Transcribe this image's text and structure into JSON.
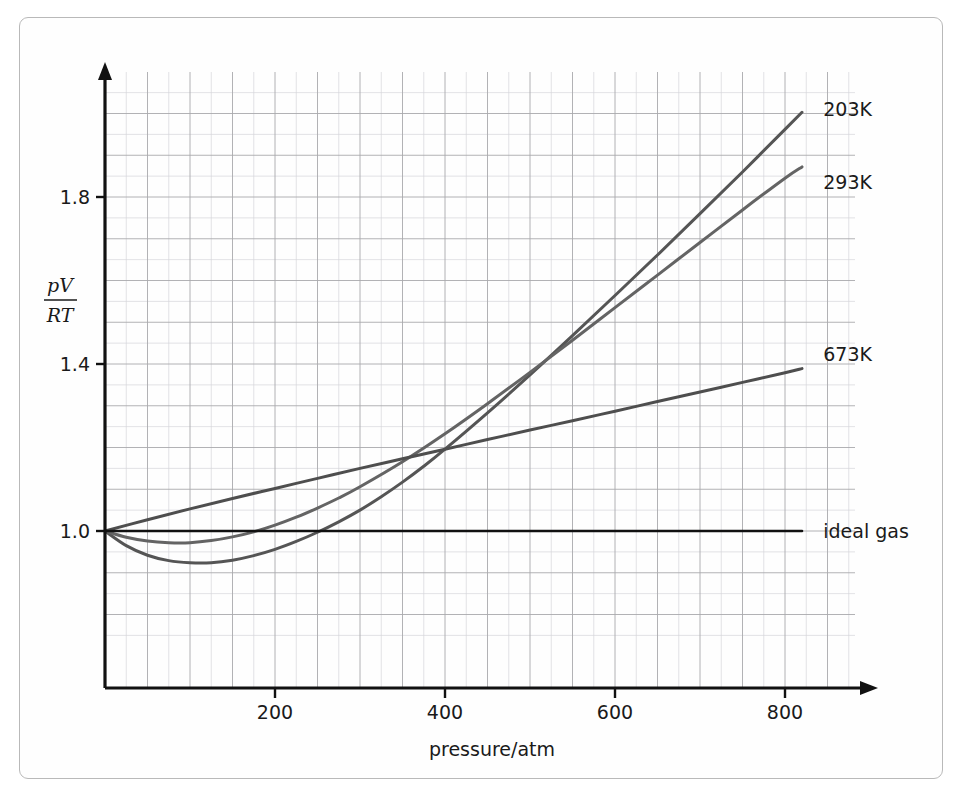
{
  "chart_data": {
    "type": "line",
    "title": "",
    "subtitle": "",
    "xlabel": "pressure/atm",
    "ylabel": "pV/RT",
    "ylabel_numerator": "pV",
    "ylabel_denominator": "RT",
    "xlim": [
      0,
      880
    ],
    "ylim": [
      0.78,
      2.08
    ],
    "xticks": [
      200,
      400,
      600,
      800
    ],
    "xtick_labels": [
      "200",
      "400",
      "600",
      "800"
    ],
    "yticks": [
      1.0,
      1.4,
      1.8
    ],
    "ytick_labels": [
      "1.0",
      "1.4",
      "1.8"
    ],
    "grid": true,
    "grid_minor": true,
    "grid_spacing_x": 50,
    "grid_spacing_y": 0.1,
    "legend": "inline-right-of-curve-ends",
    "series": [
      {
        "name": "203K",
        "label": "203K",
        "color": "#555555",
        "x": [
          0,
          25,
          50,
          75,
          100,
          125,
          150,
          175,
          200,
          225,
          250,
          275,
          300,
          325,
          350,
          375,
          400,
          450,
          500,
          550,
          600,
          650,
          700,
          750,
          800,
          820
        ],
        "y": [
          1.0,
          0.965,
          0.942,
          0.929,
          0.924,
          0.924,
          0.93,
          0.941,
          0.956,
          0.975,
          0.997,
          1.022,
          1.05,
          1.082,
          1.117,
          1.155,
          1.196,
          1.283,
          1.374,
          1.468,
          1.564,
          1.661,
          1.76,
          1.86,
          1.962,
          2.003
        ]
      },
      {
        "name": "293K",
        "label": "293K",
        "color": "#646464",
        "x": [
          0,
          25,
          50,
          75,
          100,
          125,
          150,
          175,
          200,
          225,
          250,
          275,
          300,
          350,
          400,
          450,
          500,
          550,
          600,
          650,
          700,
          750,
          800,
          820
        ],
        "y": [
          1.0,
          0.985,
          0.976,
          0.972,
          0.972,
          0.977,
          0.986,
          0.998,
          1.014,
          1.033,
          1.055,
          1.079,
          1.106,
          1.166,
          1.233,
          1.305,
          1.38,
          1.457,
          1.535,
          1.613,
          1.691,
          1.769,
          1.845,
          1.872
        ]
      },
      {
        "name": "673K",
        "label": "673K",
        "color": "#4e4e4e",
        "x": [
          0,
          50,
          100,
          150,
          200,
          250,
          300,
          350,
          400,
          450,
          500,
          550,
          600,
          650,
          700,
          750,
          800,
          820
        ],
        "y": [
          1.0,
          1.027,
          1.053,
          1.078,
          1.102,
          1.126,
          1.15,
          1.173,
          1.196,
          1.219,
          1.242,
          1.264,
          1.287,
          1.31,
          1.333,
          1.356,
          1.379,
          1.389
        ]
      },
      {
        "name": "ideal gas",
        "label": "ideal gas",
        "color": "#111111",
        "x": [
          0,
          820
        ],
        "y": [
          1.0,
          1.0
        ]
      }
    ],
    "annotations": [
      {
        "text": "203K",
        "x": 845,
        "y": 2.01
      },
      {
        "text": "293K",
        "x": 845,
        "y": 1.835
      },
      {
        "text": "673K",
        "x": 845,
        "y": 1.425
      },
      {
        "text": "ideal gas",
        "x": 845,
        "y": 1.0
      }
    ]
  },
  "axes": {
    "x_arrow": true,
    "y_arrow": true,
    "x_axis_name": "pressure-axis",
    "y_axis_name": "compressibility-axis"
  },
  "colors": {
    "grid_major": "#a9a9ad",
    "grid_minor": "#d5d5da",
    "axis": "#111111",
    "frame": "#b9b9b9",
    "background": "#ffffff",
    "text": "#1a1a1a"
  }
}
